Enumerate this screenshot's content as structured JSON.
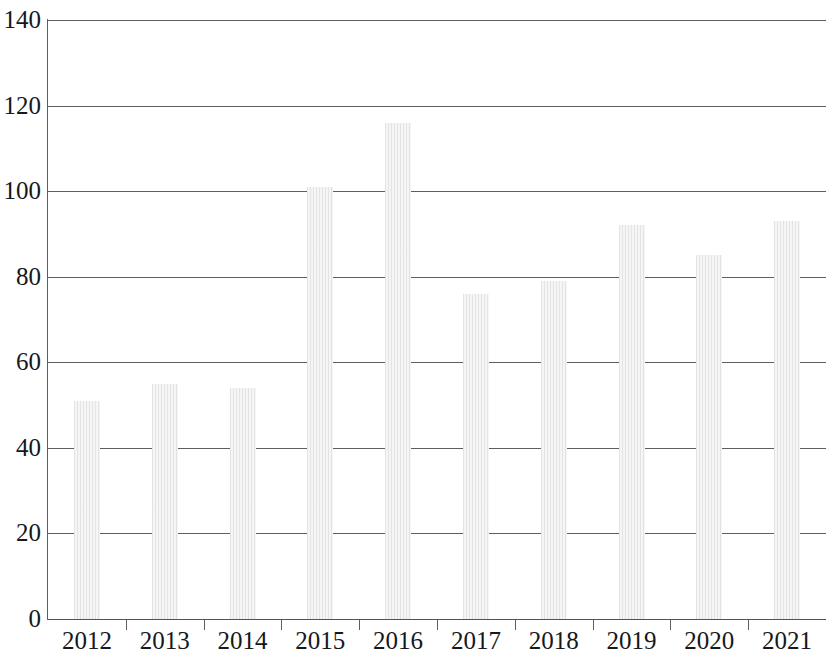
{
  "chart_data": {
    "type": "bar",
    "title": "",
    "subtitle": "",
    "xlabel": "",
    "ylabel": "",
    "categories": [
      "2012",
      "2013",
      "2014",
      "2015",
      "2016",
      "2017",
      "2018",
      "2019",
      "2020",
      "2021"
    ],
    "values": [
      51,
      55,
      54,
      101,
      116,
      76,
      79,
      92,
      85,
      93
    ],
    "series": [
      {
        "name": "",
        "values": [
          51,
          55,
          54,
          101,
          116,
          76,
          79,
          92,
          85,
          93
        ]
      }
    ],
    "ylim": [
      0,
      140
    ],
    "ytick_labels": [
      "0",
      "20",
      "40",
      "60",
      "80",
      "100",
      "120",
      "140"
    ],
    "ytick_values": [
      0,
      20,
      40,
      60,
      80,
      100,
      120,
      140
    ],
    "grid": true,
    "grid_axis": "y",
    "legend": false,
    "legend_position": "none",
    "bar_color": "#f1f1f1",
    "gridline_color": "#5b5f63",
    "axis_color": "#5b5f63",
    "text_color": "#16181a",
    "background_color": "#ffffff",
    "annotations": []
  }
}
